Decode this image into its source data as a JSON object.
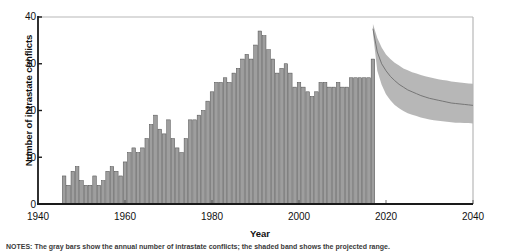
{
  "chart_data": {
    "type": "bar",
    "title": "",
    "xlabel": "Year",
    "ylabel": "Number of intrastate conflicts",
    "xlim": [
      1940,
      2040
    ],
    "ylim": [
      0,
      40
    ],
    "xticks": [
      1940,
      1960,
      1980,
      2000,
      2020,
      2040
    ],
    "yticks": [
      0,
      10,
      20,
      30,
      40
    ],
    "grid": false,
    "legend": "none",
    "bar_color": "#9e9e9e",
    "bar_edge_color": "#4d4d4d",
    "band_color": "#b3b3b3",
    "median_line_color": "#6e6e6e",
    "axis_color": "#1a1a1a",
    "frame_color": "#b8b8b8",
    "series": [
      {
        "name": "Observed intrastate conflicts",
        "type": "bar",
        "x": [
          1946,
          1947,
          1948,
          1949,
          1950,
          1951,
          1952,
          1953,
          1954,
          1955,
          1956,
          1957,
          1958,
          1959,
          1960,
          1961,
          1962,
          1963,
          1964,
          1965,
          1966,
          1967,
          1968,
          1969,
          1970,
          1971,
          1972,
          1973,
          1974,
          1975,
          1976,
          1977,
          1978,
          1979,
          1980,
          1981,
          1982,
          1983,
          1984,
          1985,
          1986,
          1987,
          1988,
          1989,
          1990,
          1991,
          1992,
          1993,
          1994,
          1995,
          1996,
          1997,
          1998,
          1999,
          2000,
          2001,
          2002,
          2003,
          2004,
          2005,
          2006,
          2007,
          2008,
          2009,
          2010,
          2011,
          2012,
          2013,
          2014,
          2015,
          2016,
          2017
        ],
        "values": [
          6,
          4,
          7,
          8,
          5,
          4,
          4,
          6,
          4,
          5,
          7,
          8,
          7,
          6,
          9,
          11,
          12,
          11,
          12,
          14,
          17,
          19,
          16,
          15,
          18,
          14,
          12,
          11,
          14,
          18,
          18,
          19,
          20,
          22,
          24,
          26,
          26,
          27,
          26,
          28,
          29,
          31,
          32,
          31,
          34,
          37,
          36,
          33,
          31,
          28,
          29,
          30,
          28,
          25,
          26,
          25,
          24,
          23,
          24,
          26,
          26,
          25,
          25,
          26,
          25,
          25,
          27,
          27,
          27,
          27,
          27,
          31
        ]
      },
      {
        "name": "Projection median",
        "type": "line",
        "x": [
          2017,
          2018,
          2019,
          2020,
          2021,
          2022,
          2023,
          2024,
          2025,
          2026,
          2027,
          2028,
          2029,
          2030,
          2031,
          2032,
          2033,
          2034,
          2035,
          2036,
          2037,
          2038,
          2039,
          2040
        ],
        "values": [
          37.5,
          32.5,
          30.0,
          28.5,
          27.3,
          26.4,
          25.6,
          25.0,
          24.4,
          24.0,
          23.6,
          23.2,
          22.9,
          22.6,
          22.4,
          22.2,
          22.0,
          21.8,
          21.6,
          21.5,
          21.4,
          21.3,
          21.2,
          21.1
        ]
      },
      {
        "name": "Projection uncertainty band",
        "type": "band",
        "x": [
          2017,
          2018,
          2019,
          2020,
          2021,
          2022,
          2023,
          2024,
          2025,
          2026,
          2027,
          2028,
          2029,
          2030,
          2031,
          2032,
          2033,
          2034,
          2035,
          2036,
          2037,
          2038,
          2039,
          2040
        ],
        "upper": [
          38.5,
          35.5,
          33.5,
          32.0,
          31.0,
          30.2,
          29.6,
          29.0,
          28.6,
          28.2,
          27.9,
          27.6,
          27.3,
          27.1,
          26.9,
          26.7,
          26.5,
          26.4,
          26.2,
          26.1,
          26.0,
          25.9,
          25.8,
          25.7
        ],
        "lower": [
          36.5,
          28.5,
          25.5,
          23.5,
          22.2,
          21.2,
          20.5,
          19.9,
          19.4,
          19.1,
          18.8,
          18.5,
          18.3,
          18.1,
          17.9,
          17.8,
          17.7,
          17.6,
          17.5,
          17.4,
          17.4,
          17.3,
          17.3,
          17.2
        ]
      }
    ]
  },
  "axes": {
    "ylabel": "Number of intrastate conflicts",
    "xlabel": "Year",
    "ytick_labels": [
      "40",
      "30",
      "20",
      "10",
      "0"
    ],
    "xtick_labels": [
      "1940",
      "1960",
      "1980",
      "2000",
      "2020",
      "2040"
    ]
  },
  "footnote": {
    "text": "NOTES: The gray bars show the annual number of intrastate conflicts; the shaded band shows the projected range."
  }
}
